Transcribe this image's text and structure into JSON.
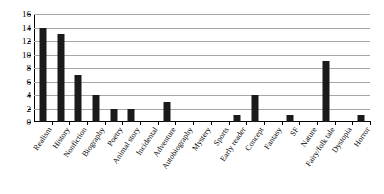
{
  "chart_data": {
    "type": "bar",
    "title": "",
    "subtitle": "",
    "xlabel": "",
    "ylabel": "",
    "ylim": [
      0,
      16
    ],
    "ytick_step": 2,
    "yticks": [
      0,
      2,
      4,
      6,
      8,
      10,
      12,
      14,
      16
    ],
    "grid": true,
    "legend": false,
    "bar_color": "#1a1a1a",
    "grid_color": "#a6a6a6",
    "axis_color": "#000000",
    "categories": [
      "Realism",
      "History",
      "Nonfiction",
      "Biography",
      "Poetry",
      "Animal story",
      "Incidental",
      "Adventure",
      "Autobiography",
      "Mystery",
      "Sports",
      "Early reader",
      "Concept",
      "Fantasy",
      "SF",
      "Nature",
      "Fairy/folk tale",
      "Dystopia",
      "Horror"
    ],
    "values": [
      14,
      13,
      7,
      4,
      2,
      2,
      0,
      3,
      0,
      0,
      0,
      1,
      4,
      0,
      1,
      0,
      9,
      0,
      1
    ]
  }
}
